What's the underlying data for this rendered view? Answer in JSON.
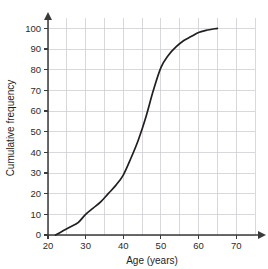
{
  "chart_data": {
    "type": "line",
    "title": "",
    "subtitle": "",
    "xlabel": "Age (years)",
    "ylabel": "Cumulative frequency",
    "xlim": [
      20,
      75
    ],
    "ylim": [
      0,
      105
    ],
    "x_ticks": [
      20,
      30,
      40,
      50,
      60,
      70
    ],
    "x_tick_labels": [
      "20",
      "30",
      "40",
      "50",
      "60",
      "70"
    ],
    "y_ticks": [
      0,
      10,
      20,
      30,
      40,
      50,
      60,
      70,
      80,
      90,
      100
    ],
    "y_tick_labels": [
      "0",
      "10",
      "20",
      "30",
      "40",
      "50",
      "60",
      "70",
      "80",
      "90",
      "100"
    ],
    "x_gridlines": [
      20,
      25,
      30,
      35,
      40,
      45,
      50,
      55,
      60,
      65,
      70,
      75
    ],
    "y_gridlines": [
      0,
      10,
      20,
      30,
      40,
      50,
      60,
      70,
      80,
      90,
      100
    ],
    "grid": true,
    "legend": null,
    "legend_position": "none",
    "series": [
      {
        "name": "Cumulative frequency",
        "color": "#231f20",
        "x": [
          22,
          24,
          26,
          28,
          30,
          32,
          34,
          36,
          38,
          40,
          42,
          44,
          46,
          48,
          50,
          52,
          54,
          56,
          58,
          60,
          62,
          65
        ],
        "values": [
          0,
          2,
          4,
          6,
          10,
          13,
          16,
          20,
          24,
          29,
          37,
          46,
          57,
          70,
          81,
          87,
          91,
          94,
          96,
          98,
          99,
          100
        ]
      }
    ],
    "annotations": []
  },
  "axes": {
    "x_axis_name": "Age (years)",
    "y_axis_name": "Cumulative frequency"
  }
}
